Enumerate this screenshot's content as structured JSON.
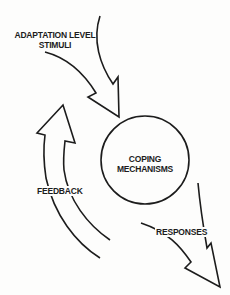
{
  "diagram": {
    "nodes": [
      {
        "id": "input",
        "label_line1": "ADAPTATION LEVEL",
        "label_line2": "STIMULI"
      },
      {
        "id": "center",
        "label_line1": "COPING",
        "label_line2": "MECHANISMS"
      },
      {
        "id": "output",
        "label": "RESPONSES"
      },
      {
        "id": "loop",
        "label": "FEEDBACK"
      }
    ],
    "edges": [
      {
        "from": "input",
        "to": "center"
      },
      {
        "from": "center",
        "to": "output"
      },
      {
        "from": "output",
        "to": "input",
        "label": "FEEDBACK"
      }
    ],
    "colors": {
      "stroke": "#1c1c1c",
      "background": "#fdfdfc"
    }
  }
}
